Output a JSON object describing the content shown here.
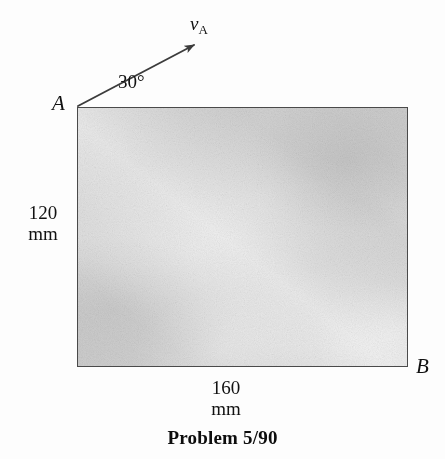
{
  "figure": {
    "caption": "Problem 5/90",
    "body": {
      "name": "rectangular-plate",
      "corner_labels": {
        "top_left": "A",
        "bottom_right": "B"
      },
      "dimensions": {
        "height_value": "120",
        "height_unit": "mm",
        "width_value": "160",
        "width_unit": "mm"
      }
    },
    "vector": {
      "symbol": "v",
      "subscript": "A",
      "angle_label": "30°",
      "description": "velocity-arrow-at-point-A"
    },
    "colors": {
      "plate_fill": "#d2d2d2",
      "plate_edge": "#4a4a4a",
      "ink": "#111111",
      "background": "#fdfdfd"
    }
  }
}
